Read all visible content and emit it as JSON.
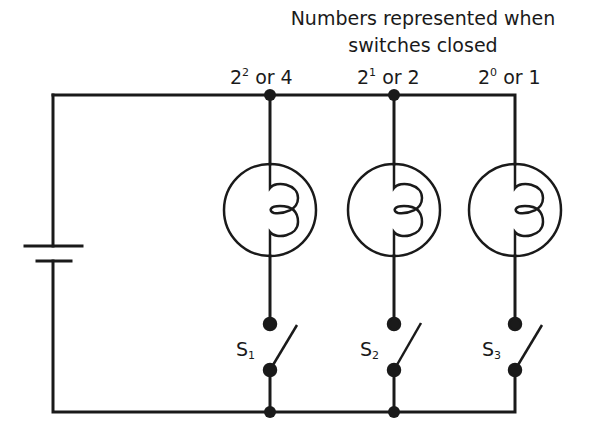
{
  "title": {
    "line1": "Numbers represented when",
    "line2": "switches closed"
  },
  "branches": [
    {
      "base": "2",
      "exp": "2",
      "suffix": " or 4",
      "switch_letter": "S",
      "switch_index": "1",
      "value": 4
    },
    {
      "base": "2",
      "exp": "1",
      "suffix": " or 2",
      "switch_letter": "S",
      "switch_index": "2",
      "value": 2
    },
    {
      "base": "2",
      "exp": "0",
      "suffix": " or 1",
      "switch_letter": "S",
      "switch_index": "3",
      "value": 1
    }
  ],
  "components": {
    "battery": "battery-icon",
    "bulbs": [
      "bulb-icon",
      "bulb-icon",
      "bulb-icon"
    ],
    "switches": [
      "open-switch-icon",
      "open-switch-icon",
      "open-switch-icon"
    ]
  },
  "colors": {
    "line": "#1a1a1a",
    "background": "#ffffff"
  }
}
